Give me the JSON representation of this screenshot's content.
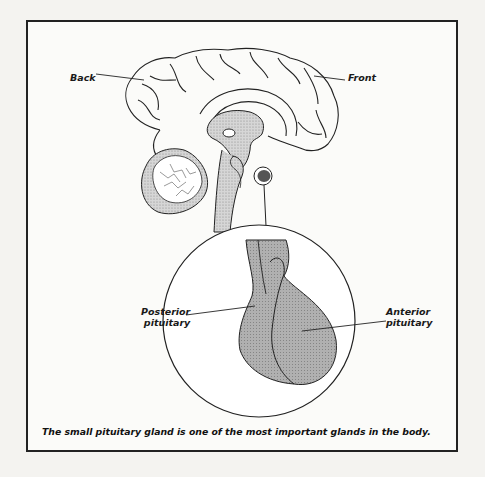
{
  "figure": {
    "labels": {
      "back": "Back",
      "front": "Front",
      "posterior_line1": "Posterior",
      "posterior_line2": "pituitary",
      "anterior_line1": "Anterior",
      "anterior_line2": "pituitary"
    },
    "caption": "The small pituitary gland is one of the most important glands in the body.",
    "colors": {
      "frame_border": "#222222",
      "gland_fill": "#a9a9a9",
      "pituitary_dark": "#555555",
      "stipple": "#bdbdbd"
    }
  }
}
